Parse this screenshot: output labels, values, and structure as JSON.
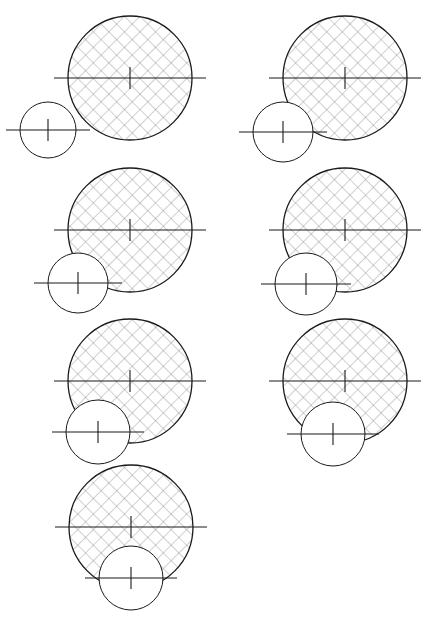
{
  "figure": {
    "title": "Circle tangency and intersection sequence",
    "width": 434,
    "height": 626,
    "background_color": "#ffffff",
    "line_color": "#1a1a1a",
    "hatch_color": "#555555",
    "centerline_color": "#1a1a1a",
    "panel_count": 7,
    "columns": 2
  },
  "style": {
    "large_circle_stroke_width": 1.3,
    "small_circle_stroke_width": 1.0,
    "centerline_stroke_width": 1.1,
    "hatch_stroke_width": 0.55,
    "hatch_spacing": 11,
    "hatch_angle_degrees": 45,
    "hatch_cross": true,
    "center_tick_half_length": 11,
    "centerline_overhang": 14
  },
  "panels": [
    {
      "id": "panel-1",
      "name": "top-left",
      "row": 1,
      "column": 1,
      "large_circle": {
        "cx": 130,
        "cy": 78,
        "r": 62,
        "hatched": true
      },
      "small_circle": {
        "cx": 48,
        "cy": 130,
        "r": 28,
        "hatched": false
      },
      "relation": "externally-tangent-lower-left"
    },
    {
      "id": "panel-2",
      "name": "top-right",
      "row": 1,
      "column": 2,
      "large_circle": {
        "cx": 345,
        "cy": 78,
        "r": 62,
        "hatched": true
      },
      "small_circle": {
        "cx": 283,
        "cy": 132,
        "r": 30,
        "hatched": false
      },
      "relation": "externally-tangent-lower-left"
    },
    {
      "id": "panel-3",
      "name": "middle-left",
      "row": 2,
      "column": 1,
      "large_circle": {
        "cx": 130,
        "cy": 230,
        "r": 62,
        "hatched": true
      },
      "small_circle": {
        "cx": 78,
        "cy": 283,
        "r": 30,
        "hatched": false
      },
      "relation": "slightly-overlapping-lower-left"
    },
    {
      "id": "panel-4",
      "name": "middle-right",
      "row": 2,
      "column": 2,
      "large_circle": {
        "cx": 345,
        "cy": 230,
        "r": 62,
        "hatched": true
      },
      "small_circle": {
        "cx": 306,
        "cy": 284,
        "r": 31,
        "hatched": false
      },
      "relation": "overlapping-lower-left"
    },
    {
      "id": "panel-5",
      "name": "lower-left",
      "row": 3,
      "column": 1,
      "large_circle": {
        "cx": 130,
        "cy": 381,
        "r": 62,
        "hatched": true
      },
      "small_circle": {
        "cx": 98,
        "cy": 432,
        "r": 32,
        "hatched": false
      },
      "relation": "deeply-overlapping-lower-left"
    },
    {
      "id": "panel-6",
      "name": "lower-right",
      "row": 3,
      "column": 2,
      "large_circle": {
        "cx": 345,
        "cy": 381,
        "r": 62,
        "hatched": true
      },
      "small_circle": {
        "cx": 333,
        "cy": 434,
        "r": 32,
        "hatched": false
      },
      "relation": "deeply-overlapping-bottom"
    },
    {
      "id": "panel-7",
      "name": "bottom-center",
      "row": 4,
      "column": 1,
      "large_circle": {
        "cx": 131,
        "cy": 527,
        "r": 62,
        "hatched": true
      },
      "small_circle": {
        "cx": 131,
        "cy": 578,
        "r": 32,
        "hatched": false
      },
      "relation": "concentric-vertical-bottom"
    }
  ]
}
